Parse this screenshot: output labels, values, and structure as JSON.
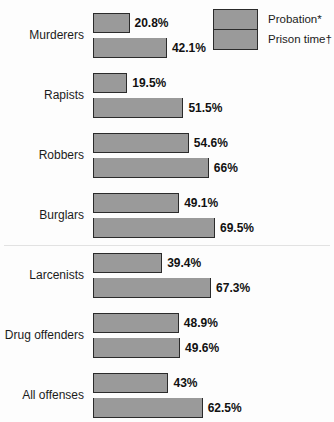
{
  "chart_data": {
    "type": "bar",
    "title": "",
    "subtitle": "",
    "xlabel": "",
    "ylabel": "",
    "xlim": [
      0,
      100
    ],
    "grid": false,
    "orientation": "horizontal",
    "legend_position": "top-right",
    "value_suffix": "%",
    "categories": [
      "Murderers",
      "Rapists",
      "Robbers",
      "Burglars",
      "Larcenists",
      "Drug offenders",
      "All offenses"
    ],
    "series": [
      {
        "name": "Probation*",
        "values": [
          20.8,
          19.5,
          54.6,
          49.1,
          39.4,
          48.9,
          43
        ],
        "labels": [
          "20.8%",
          "19.5%",
          "54.6%",
          "49.1%",
          "39.4%",
          "48.9%",
          "43%"
        ]
      },
      {
        "name": "Prison time†",
        "values": [
          42.1,
          51.5,
          66,
          69.5,
          67.3,
          49.6,
          62.5
        ],
        "labels": [
          "42.1%",
          "51.5%",
          "66%",
          "69.5%",
          "67.3%",
          "49.6%",
          "62.5%"
        ]
      }
    ],
    "colors": {
      "bar_fill": "#9a9a9a",
      "bar_stroke": "#2b2b2b",
      "background": "#fdfdfd",
      "text": "#1b1b1b"
    },
    "divider_after_category_index": 3
  },
  "legend": {
    "entries": [
      {
        "label": "Probation*"
      },
      {
        "label": "Prison time†"
      }
    ]
  }
}
